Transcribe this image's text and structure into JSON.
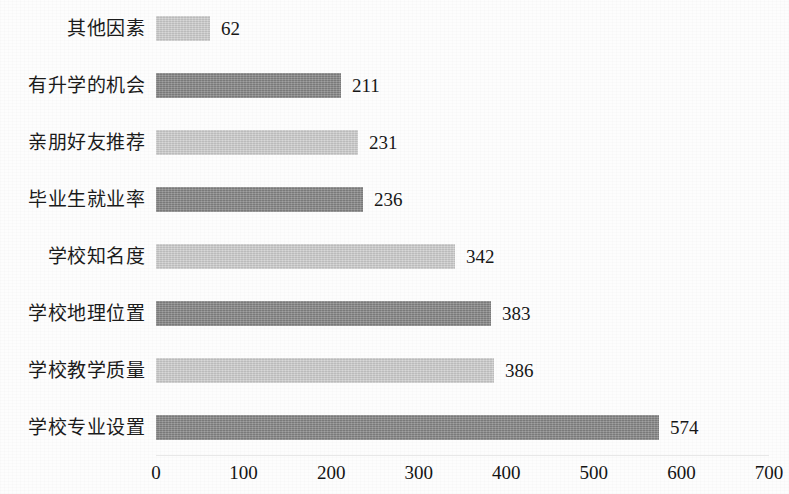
{
  "chart_data": {
    "type": "bar",
    "orientation": "horizontal",
    "title": "",
    "subtitle": "",
    "xlabel": "",
    "ylabel": "",
    "categories": [
      "其他因素",
      "有升学的机会",
      "亲朋好友推荐",
      "毕业生就业率",
      "学校知名度",
      "学校地理位置",
      "学校教学质量",
      "学校专业设置"
    ],
    "values": [
      62,
      211,
      231,
      236,
      342,
      383,
      386,
      574
    ],
    "value_labels": [
      "62",
      "211",
      "231",
      "236",
      "342",
      "383",
      "386",
      "574"
    ],
    "bar_colors": [
      "#cdcdcd",
      "#858585",
      "#cdcdcd",
      "#858585",
      "#cdcdcd",
      "#858585",
      "#cdcdcd",
      "#858585"
    ],
    "bar_shades": [
      "light",
      "dark",
      "light",
      "dark",
      "light",
      "dark",
      "light",
      "dark"
    ],
    "xlim": [
      0,
      700
    ],
    "xticks": [
      0,
      100,
      200,
      300,
      400,
      500,
      600,
      700
    ],
    "xtick_labels": [
      "0",
      "100",
      "200",
      "300",
      "400",
      "500",
      "600",
      "700"
    ],
    "grid": false,
    "legend": null,
    "legend_position": "none",
    "annotations": [],
    "background_color": "#fdfdfd",
    "text_color": "#1a1a1a",
    "data_label_position": "outside-end"
  }
}
